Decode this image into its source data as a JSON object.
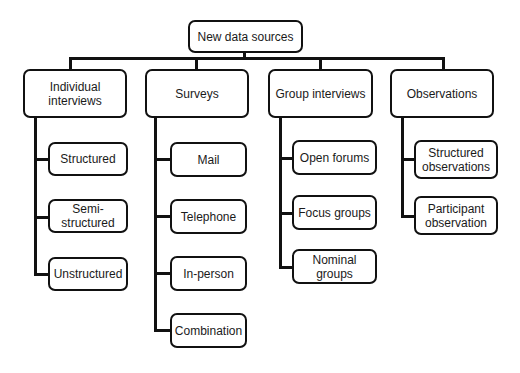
{
  "root": {
    "label": "New data sources"
  },
  "categories": [
    {
      "label": "Individual\ninterviews",
      "children": [
        "Structured",
        "Semi-structured",
        "Unstructured"
      ]
    },
    {
      "label": "Surveys",
      "children": [
        "Mail",
        "Telephone",
        "In-person",
        "Combination"
      ]
    },
    {
      "label": "Group interviews",
      "children": [
        "Open forums",
        "Focus groups",
        "Nominal groups"
      ]
    },
    {
      "label": "Observations",
      "children": [
        "Structured\nobservations",
        "Participant\nobservation"
      ]
    }
  ]
}
